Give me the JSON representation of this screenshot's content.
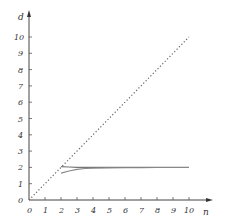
{
  "chart_data": {
    "type": "line",
    "title": "",
    "xlabel": "n",
    "ylabel": "d",
    "xlim": [
      0,
      10
    ],
    "ylim": [
      0,
      10
    ],
    "x_ticks": [
      "0",
      "1",
      "2",
      "3",
      "4",
      "5",
      "6",
      "7",
      "8",
      "9",
      "10"
    ],
    "y_ticks": [
      "0",
      "1",
      "2",
      "3",
      "4",
      "5",
      "6",
      "7",
      "8",
      "9",
      "10"
    ],
    "grid": false,
    "legend": null,
    "series": [
      {
        "name": "d = n (reference)",
        "style": "dotted",
        "x": [
          0,
          10
        ],
        "y": [
          0,
          10
        ]
      },
      {
        "name": "upper curve",
        "style": "solid",
        "x": [
          2,
          2.5,
          3,
          4,
          5,
          6,
          7,
          8,
          9,
          10
        ],
        "y": [
          2.05,
          2.02,
          2.0,
          2.0,
          2.0,
          2.0,
          2.0,
          2.0,
          2.0,
          2.0
        ]
      },
      {
        "name": "lower curve",
        "style": "solid",
        "x": [
          2,
          2.5,
          3,
          3.5,
          4,
          5,
          6,
          7,
          8,
          9,
          10
        ],
        "y": [
          1.65,
          1.78,
          1.88,
          1.93,
          1.95,
          1.97,
          1.98,
          1.98,
          1.99,
          1.99,
          1.99
        ]
      }
    ]
  },
  "axes": {
    "x_label": "n",
    "y_label": "d",
    "x_tick_labels": [
      "0",
      "1",
      "2",
      "3",
      "4",
      "5",
      "6",
      "7",
      "8",
      "9",
      "10"
    ],
    "y_tick_labels": [
      "0",
      "1",
      "2",
      "3",
      "4",
      "5",
      "6",
      "7",
      "8",
      "9",
      "10"
    ]
  },
  "colors": {
    "axis": "#444444",
    "reference_line": "#666666",
    "curve_upper": "#777777",
    "curve_lower": "#888888"
  }
}
